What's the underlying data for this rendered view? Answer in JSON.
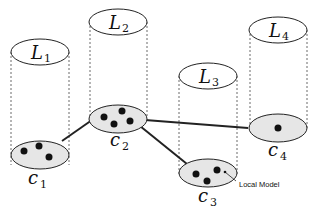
{
  "diagram": {
    "type": "cylinder-cluster-network",
    "layers": [
      {
        "id": "L1",
        "label": "L",
        "sub": "1"
      },
      {
        "id": "L2",
        "label": "L",
        "sub": "2"
      },
      {
        "id": "L3",
        "label": "L",
        "sub": "3"
      },
      {
        "id": "L4",
        "label": "L",
        "sub": "4"
      }
    ],
    "clusters": [
      {
        "id": "c1",
        "label": "c",
        "sub": "1",
        "points": 3
      },
      {
        "id": "c2",
        "label": "c",
        "sub": "2",
        "points": 4
      },
      {
        "id": "c3",
        "label": "c",
        "sub": "3",
        "points": 3
      },
      {
        "id": "c4",
        "label": "c",
        "sub": "4",
        "points": 1
      }
    ],
    "edges": [
      [
        "c1",
        "c2"
      ],
      [
        "c2",
        "c3"
      ],
      [
        "c2",
        "c4"
      ]
    ],
    "annotation": "Local Model",
    "colors": {
      "ellipse_fill": "#e6e6e6",
      "stroke": "#222222",
      "point": "#111111"
    }
  }
}
